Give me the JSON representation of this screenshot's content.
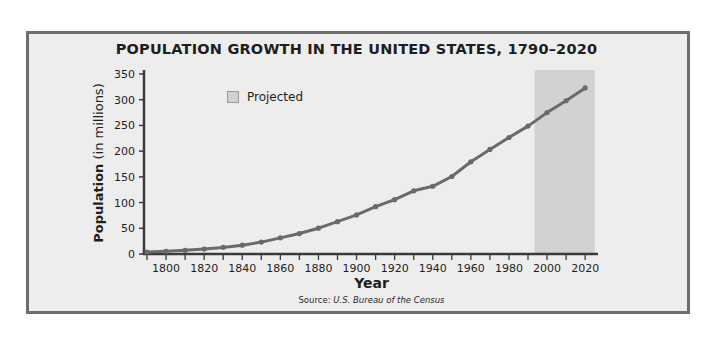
{
  "chart_data": {
    "type": "line",
    "title": "POPULATION GROWTH IN THE UNITED STATES, 1790–2020",
    "xlabel": "Year",
    "ylabel": "Population (in millions)",
    "ylabel_main": "Population",
    "ylabel_unit": "(in millions)",
    "source_prefix": "Source: ",
    "source_text": "U.S. Bureau of the Census",
    "xlim": [
      1790,
      2020
    ],
    "ylim": [
      0,
      350
    ],
    "x_ticks": [
      1800,
      1820,
      1840,
      1860,
      1880,
      1900,
      1920,
      1940,
      1960,
      1980,
      2000,
      2020
    ],
    "y_ticks": [
      0,
      50,
      100,
      150,
      200,
      250,
      300,
      350
    ],
    "grid": false,
    "legend": [
      {
        "label": "Projected",
        "color": "#d2d2d2"
      }
    ],
    "legend_position": "upper left",
    "projected_range": [
      1995,
      2025
    ],
    "series": [
      {
        "name": "Population",
        "color": "#6a6a6a",
        "x": [
          1790,
          1800,
          1810,
          1820,
          1830,
          1840,
          1850,
          1860,
          1870,
          1880,
          1890,
          1900,
          1910,
          1920,
          1930,
          1940,
          1950,
          1960,
          1970,
          1980,
          1990,
          2000,
          2010,
          2020
        ],
        "values": [
          3.9,
          5.3,
          7.2,
          9.6,
          12.9,
          17.1,
          23.2,
          31.4,
          39.8,
          50.2,
          62.9,
          76.0,
          92.0,
          105.7,
          122.8,
          131.7,
          150.7,
          179.3,
          203.3,
          226.5,
          248.7,
          275.0,
          298.0,
          323.0
        ]
      }
    ]
  },
  "colors": {
    "frame_border": "#6d6d6d",
    "panel_background": "#ededed",
    "line": "#6a6a6a",
    "projected_band": "#d2d2d2",
    "axis": "#3a3a3a"
  }
}
